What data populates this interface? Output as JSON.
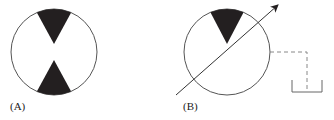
{
  "figure": {
    "panels": [
      {
        "label": "(A)",
        "symbol": "fixed-displacement-pump/motor (two triangles, bidirectional)"
      },
      {
        "label": "(B)",
        "symbol": "variable-displacement pump with drain line to tank"
      }
    ],
    "colors": {
      "stroke": "#333333",
      "fill": "#231f20",
      "dashed": "#888888"
    }
  }
}
